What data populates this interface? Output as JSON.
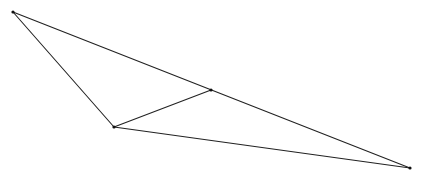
{
  "diagram": {
    "type": "triangle-with-segment",
    "stroke_color": "#222222",
    "points": {
      "A": {
        "x": 13,
        "y": 12
      },
      "B": {
        "x": 114,
        "y": 127
      },
      "C": {
        "x": 410,
        "y": 168
      },
      "D": {
        "x": 211,
        "y": 90
      }
    },
    "segments": [
      {
        "from": "A",
        "to": "B"
      },
      {
        "from": "A",
        "to": "C"
      },
      {
        "from": "B",
        "to": "C"
      },
      {
        "from": "B",
        "to": "D"
      }
    ]
  }
}
